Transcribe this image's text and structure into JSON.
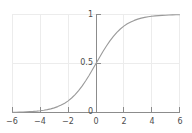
{
  "chart_data": {
    "type": "line",
    "title": "",
    "subtitle": "",
    "xlabel": "",
    "ylabel": "",
    "xlim": [
      -6.6,
      6.6
    ],
    "ylim": [
      -0.06,
      1.06
    ],
    "grid": true,
    "legend": null,
    "legend_position": "none",
    "xticks": [
      -6,
      -4,
      -2,
      0,
      2,
      4,
      6
    ],
    "xticklabels": [
      "−6",
      "−4",
      "−2",
      "0",
      "2",
      "4",
      "6"
    ],
    "yticks": [
      0,
      0.5,
      1
    ],
    "yticklabels": [
      "0",
      "0.5",
      "1"
    ],
    "series": [
      {
        "name": "sigmoid",
        "color": "#9a9a9a",
        "x": [
          -6,
          -5.75,
          -5.5,
          -5.25,
          -5,
          -4.75,
          -4.5,
          -4.25,
          -4,
          -3.75,
          -3.5,
          -3.25,
          -3,
          -2.75,
          -2.5,
          -2.25,
          -2,
          -1.75,
          -1.5,
          -1.25,
          -1,
          -0.75,
          -0.5,
          -0.25,
          0,
          0.25,
          0.5,
          0.75,
          1,
          1.25,
          1.5,
          1.75,
          2,
          2.25,
          2.5,
          2.75,
          3,
          3.25,
          3.5,
          3.75,
          4,
          4.25,
          4.5,
          4.75,
          5,
          5.25,
          5.5,
          5.75,
          6
        ],
        "y": [
          0.002,
          0.003,
          0.004,
          0.005,
          0.007,
          0.009,
          0.011,
          0.014,
          0.018,
          0.023,
          0.029,
          0.037,
          0.047,
          0.06,
          0.076,
          0.095,
          0.119,
          0.148,
          0.182,
          0.223,
          0.269,
          0.321,
          0.378,
          0.438,
          0.5,
          0.562,
          0.622,
          0.679,
          0.731,
          0.777,
          0.818,
          0.852,
          0.881,
          0.905,
          0.924,
          0.94,
          0.953,
          0.963,
          0.971,
          0.977,
          0.982,
          0.986,
          0.989,
          0.991,
          0.993,
          0.995,
          0.996,
          0.997,
          0.998
        ]
      }
    ]
  },
  "style": {
    "curve_color": "#9a9a9a",
    "grid_color": "#ececec",
    "axis_color": "#808080",
    "tick_text_color": "#4d4d4d",
    "background": "#ffffff"
  }
}
